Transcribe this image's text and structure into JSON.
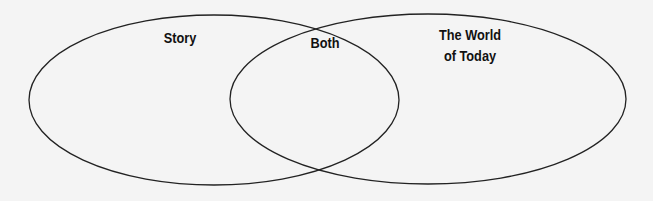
{
  "diagram": {
    "type": "venn",
    "sets": [
      {
        "label": "Story"
      },
      {
        "label": "The World of Today"
      }
    ],
    "intersection_label": "Both",
    "labels": {
      "left": "Story",
      "middle": "Both",
      "right_line1": "The World",
      "right_line2": "of Today"
    },
    "stroke_color": "#222222",
    "background_color": "#f4f4f4"
  }
}
